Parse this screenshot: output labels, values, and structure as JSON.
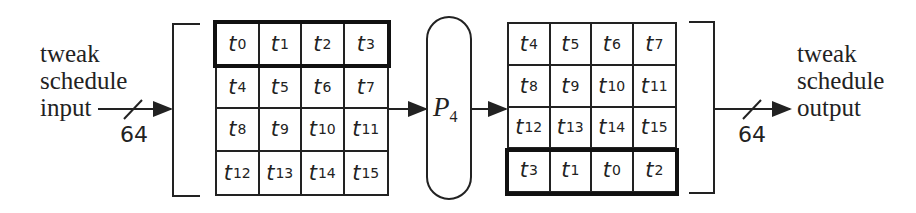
{
  "input": {
    "label_lines": [
      "tweak",
      "schedule",
      "input"
    ],
    "bit_width": "64"
  },
  "output": {
    "label_lines": [
      "tweak",
      "schedule",
      "output"
    ],
    "bit_width": "64"
  },
  "permutation": {
    "symbol": "P",
    "subscript": "4"
  },
  "left_grid": {
    "highlighted_row": 0,
    "cells": [
      [
        "0",
        "1",
        "2",
        "3"
      ],
      [
        "4",
        "5",
        "6",
        "7"
      ],
      [
        "8",
        "9",
        "10",
        "11"
      ],
      [
        "12",
        "13",
        "14",
        "15"
      ]
    ]
  },
  "right_grid": {
    "highlighted_row": 3,
    "cells": [
      [
        "4",
        "5",
        "6",
        "7"
      ],
      [
        "8",
        "9",
        "10",
        "11"
      ],
      [
        "12",
        "13",
        "14",
        "15"
      ],
      [
        "3",
        "1",
        "0",
        "2"
      ]
    ]
  },
  "cell_symbol": "t",
  "colors": {
    "line": "#222222",
    "background": "#ffffff"
  }
}
